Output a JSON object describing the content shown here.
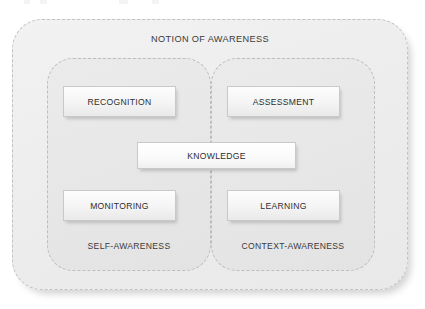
{
  "diagram": {
    "title": "NOTION OF AWARENESS",
    "groups": [
      {
        "id": "self-awareness",
        "label": "SELF-AWARENESS",
        "boxes": [
          {
            "id": "recognition",
            "label": "RECOGNITION"
          },
          {
            "id": "monitoring",
            "label": "MONITORING"
          }
        ]
      },
      {
        "id": "context-awareness",
        "label": "CONTEXT-AWARENESS",
        "boxes": [
          {
            "id": "assessment",
            "label": "ASSESSMENT"
          },
          {
            "id": "learning",
            "label": "LEARNING"
          }
        ]
      }
    ],
    "shared_box": {
      "id": "knowledge",
      "label": "KNOWLEDGE"
    },
    "colors": {
      "outer_fill": "#ededed",
      "group_fill": "#e7e7e7",
      "box_fill": "#f4f4f4",
      "border_dashed": "#c2c2c2",
      "box_border": "#c9c9c9",
      "text": "#2e2e2e",
      "page_background": "#ffffff"
    }
  }
}
